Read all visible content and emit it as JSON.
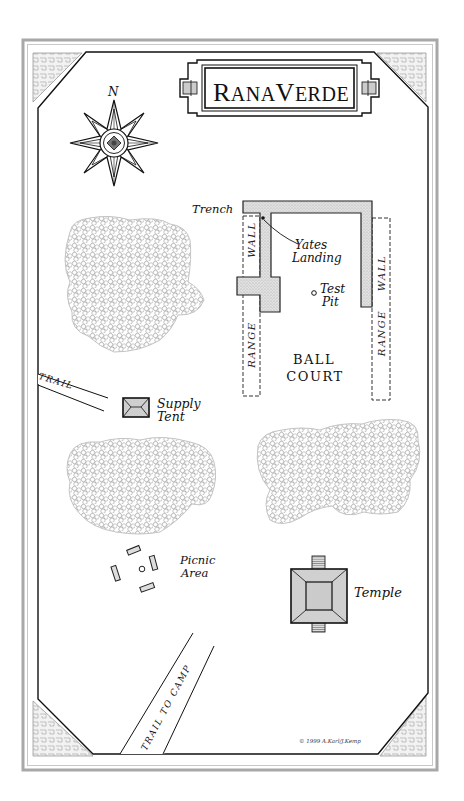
{
  "map": {
    "title": "RanaVerde",
    "title_parts": {
      "r": "R",
      "ana": "ANA",
      "v": "V",
      "erde": "ERDE"
    },
    "compass": {
      "north_label": "N",
      "icon": "compass-rose-icon"
    },
    "labels": {
      "trench": "Trench",
      "yates_landing_1": "Yates",
      "yates_landing_2": "Landing",
      "test_pit_1": "Test",
      "test_pit_2": "Pit",
      "range_wall_left_1": "WALL",
      "range_wall_left_2": "RANGE",
      "range_wall_right": "RANGE WALL",
      "ball_court_1": "BALL",
      "ball_court_2": "COURT",
      "trail": "TRAIL",
      "supply_tent_1": "Supply",
      "supply_tent_2": "Tent",
      "picnic_area_1": "Picnic",
      "picnic_area_2": "Area",
      "temple": "Temple",
      "trail_to_camp": "TRAIL TO CAMP"
    },
    "copyright": "© 1999 A.Karl/J.Kemp",
    "colors": {
      "ink": "#111111",
      "frame_gray": "#a8a8a8",
      "fill_gray": "#d4d4d4",
      "trench_fill": "#dcdcdc",
      "forest_stroke": "#9a9a9a"
    }
  }
}
